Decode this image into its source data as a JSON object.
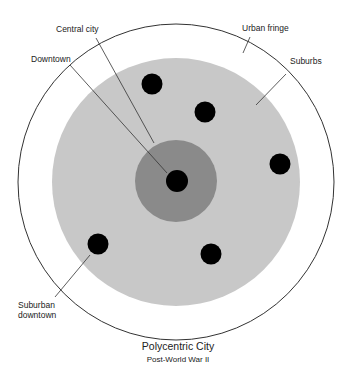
{
  "diagram": {
    "title": "Polycentric City",
    "subtitle": "Post-World War II",
    "labels": {
      "central_city": "Central city",
      "downtown": "Downtown",
      "urban_fringe": "Urban fringe",
      "suburbs": "Suburbs",
      "suburban_downtown_line1": "Suburban",
      "suburban_downtown_line2": "downtown"
    },
    "colors": {
      "urban_fringe_fill": "#ffffff",
      "suburbs_fill": "#c8c8c8",
      "central_city_fill": "#8a8a8a",
      "downtown_fill": "#000000",
      "outline": "#333333"
    },
    "zones": [
      "Downtown",
      "Central city",
      "Suburbs",
      "Urban fringe"
    ],
    "suburban_downtown_count": 5
  }
}
